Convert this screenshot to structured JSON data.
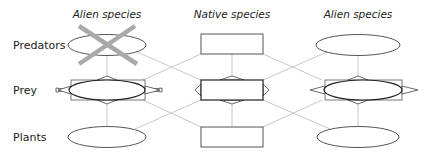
{
  "columns": [
    {
      "label": "Alien species",
      "x": 107
    },
    {
      "label": "Native species",
      "x": 232
    },
    {
      "label": "Alien species",
      "x": 358
    }
  ],
  "rows": [
    {
      "label": "Predators",
      "y": 45
    },
    {
      "label": "Prey",
      "y": 90
    },
    {
      "label": "Plants",
      "y": 137
    }
  ],
  "nodes": [
    {
      "id": "alien-left-predator",
      "shape": "ellipse",
      "crossed_out": true
    },
    {
      "id": "native-predator",
      "shape": "rectangle"
    },
    {
      "id": "alien-right-predator",
      "shape": "ellipse"
    },
    {
      "id": "alien-left-prey",
      "shape": "ellipse",
      "with_arrows": true
    },
    {
      "id": "native-prey",
      "shape": "rectangle",
      "with_arrows": true
    },
    {
      "id": "alien-right-prey",
      "shape": "ellipse",
      "with_arrows": true
    },
    {
      "id": "alien-left-plant",
      "shape": "ellipse"
    },
    {
      "id": "native-plant",
      "shape": "rectangle"
    },
    {
      "id": "alien-right-plant",
      "shape": "ellipse"
    }
  ],
  "colors": {
    "link": "#c8c8c8",
    "node_stroke": "#555555",
    "cross": "#a9a9a9",
    "text": "#222222"
  }
}
